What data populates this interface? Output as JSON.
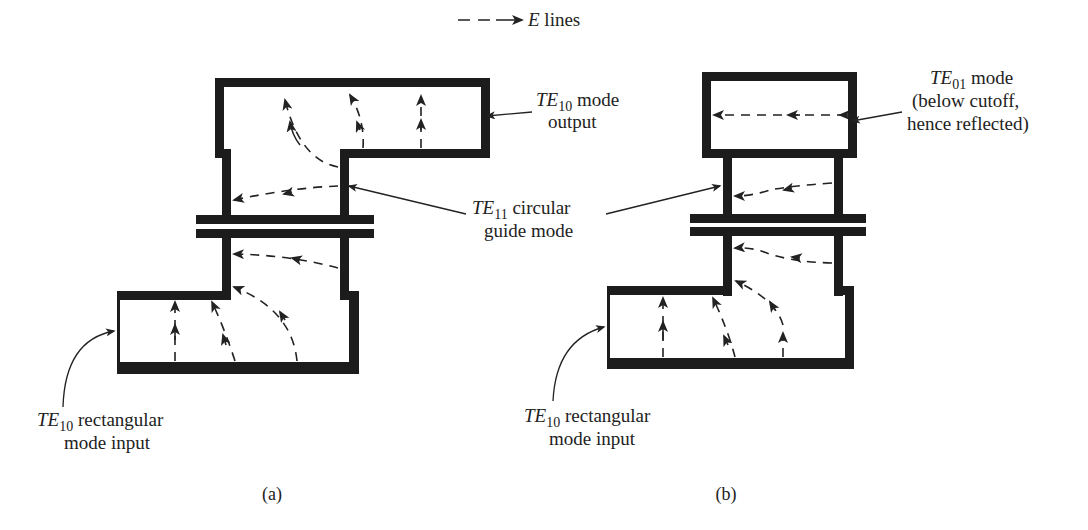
{
  "legend": {
    "symbol": "dashed-arrow",
    "var": "E",
    "text": " lines"
  },
  "figure_a": {
    "caption": "(a)",
    "output_label": {
      "mode": "TE",
      "sub": "10",
      "line1_rest": " mode",
      "line2": "output"
    },
    "circular_label": {
      "mode": "TE",
      "sub": "11",
      "line1_rest": " circular",
      "line2": "guide mode"
    },
    "input_label": {
      "mode": "TE",
      "sub": "10",
      "line1_rest": " rectangular",
      "line2": "mode input"
    }
  },
  "figure_b": {
    "caption": "(b)",
    "output_label": {
      "mode": "TE",
      "sub": "01",
      "line1_rest": " mode",
      "line2": "(below cutoff,",
      "line3": "hence reflected)"
    },
    "input_label": {
      "mode": "TE",
      "sub": "10",
      "line1_rest": " rectangular",
      "line2": "mode input"
    }
  },
  "colors": {
    "wall": "#1c1c1c",
    "background": "#ffffff",
    "ink": "#222222"
  }
}
